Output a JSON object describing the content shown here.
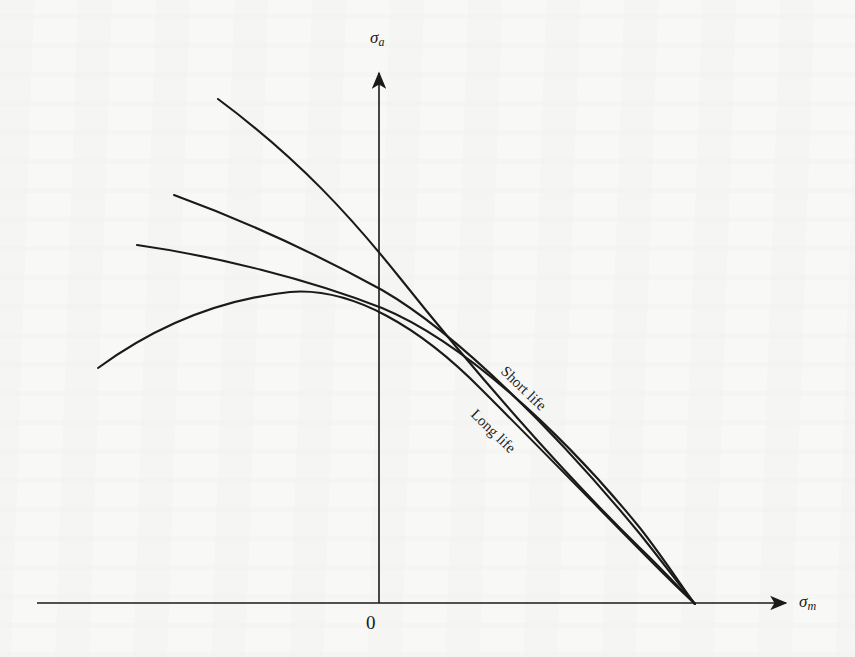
{
  "figure": {
    "kind": "haigh-constant-life-diagram",
    "background_color": "#f8f8f6",
    "ink_color": "#1a1a1a",
    "width": 855,
    "height": 657
  },
  "axes": {
    "y_label_symbol": "σ",
    "y_label_subscript": "a",
    "x_label_symbol": "σ",
    "x_label_subscript": "m",
    "origin_label": "0",
    "x_axis": {
      "x_start": 37,
      "x_end": 790,
      "y": 603,
      "arrow": "right"
    },
    "y_axis": {
      "x": 379,
      "y_start": 603,
      "y_end": 68,
      "arrow": "up"
    }
  },
  "labels": {
    "short_life": "Short life",
    "long_life": "Long life"
  },
  "chart_data": {
    "type": "line",
    "title": "",
    "xlabel": "σm",
    "ylabel": "σa",
    "grid": false,
    "legend": "inline-annotations",
    "annotations": [
      {
        "text": "Short life",
        "x": 509,
        "y": 363,
        "rotation_deg": 44
      },
      {
        "text": "Long life",
        "x": 479,
        "y": 406,
        "rotation_deg": 44
      }
    ],
    "convergence_point": {
      "x": 695,
      "y": 604
    },
    "series": [
      {
        "name": "Short life (uppermost curve)",
        "stroke_width": 2.1,
        "start": {
          "x": 218,
          "y": 99
        },
        "y_axis_crossing": 255,
        "path": "M 218,99 C 300,160 352,218 400,278 C 470,366 560,470 640,548 C 665,572 683,592 695,604"
      },
      {
        "name": "Second curve",
        "stroke_width": 2.1,
        "start": {
          "x": 174,
          "y": 195
        },
        "y_axis_crossing": 278,
        "path": "M 174,195 C 248,222 320,256 382,290 C 460,335 560,437 640,534 C 664,564 684,591 695,604"
      },
      {
        "name": "Third curve",
        "stroke_width": 2.1,
        "start": {
          "x": 137,
          "y": 245
        },
        "y_axis_crossing": 292,
        "path": "M 137,245 C 215,256 308,279 382,308 C 462,341 562,432 640,528 C 665,560 684,590 695,604"
      },
      {
        "name": "Long life (lowermost curve)",
        "stroke_width": 2.1,
        "start": {
          "x": 98,
          "y": 368
        },
        "peak": {
          "x": 290,
          "y": 292
        },
        "y_axis_crossing": 307,
        "path": "M 98,368 C 150,330 215,300 290,292 C 352,287 420,327 482,390 C 560,468 638,549 670,580 C 682,592 690,599 695,604"
      }
    ]
  }
}
